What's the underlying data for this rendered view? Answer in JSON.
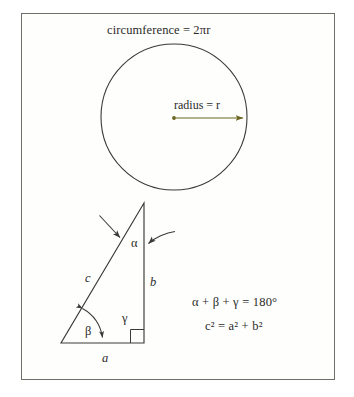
{
  "figure": {
    "title": "circumference = 2πr",
    "circle": {
      "radius_label": "radius = r",
      "center_x": 174,
      "center_y": 117,
      "radius_px": 73,
      "radius_line_color": "#6b6420"
    },
    "triangle": {
      "side_labels": {
        "hypotenuse": "c",
        "vertical": "b",
        "base": "a"
      },
      "angle_labels": {
        "top": "α",
        "bottom_left": "β",
        "bottom_right": "γ"
      },
      "apex": {
        "x": 144,
        "y": 203
      },
      "bottom_left": {
        "x": 61,
        "y": 343
      },
      "bottom_right": {
        "x": 144,
        "y": 343
      }
    },
    "equations": [
      "α + β + γ = 180°",
      "c² = a² + b²"
    ],
    "stroke_color": "#3a3a36",
    "frame_color": "#6e6e68",
    "background_color": "#fefefd"
  }
}
